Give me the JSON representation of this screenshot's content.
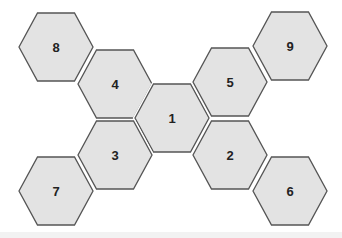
{
  "diagram": {
    "type": "hexagon-cluster",
    "fill_color": "#e3e3e3",
    "stroke_color": "#555555",
    "label_color": "#222222",
    "hex_width": 74,
    "hex_height": 68,
    "hexagons": [
      {
        "id": "8",
        "label": "8",
        "cx": 56,
        "cy": 47
      },
      {
        "id": "4",
        "label": "4",
        "cx": 115,
        "cy": 84
      },
      {
        "id": "1",
        "label": "1",
        "cx": 172,
        "cy": 118
      },
      {
        "id": "5",
        "label": "5",
        "cx": 230,
        "cy": 82
      },
      {
        "id": "9",
        "label": "9",
        "cx": 290,
        "cy": 46
      },
      {
        "id": "3",
        "label": "3",
        "cx": 115,
        "cy": 155
      },
      {
        "id": "7",
        "label": "7",
        "cx": 56,
        "cy": 191
      },
      {
        "id": "2",
        "label": "2",
        "cx": 230,
        "cy": 155
      },
      {
        "id": "6",
        "label": "6",
        "cx": 290,
        "cy": 191
      }
    ]
  }
}
